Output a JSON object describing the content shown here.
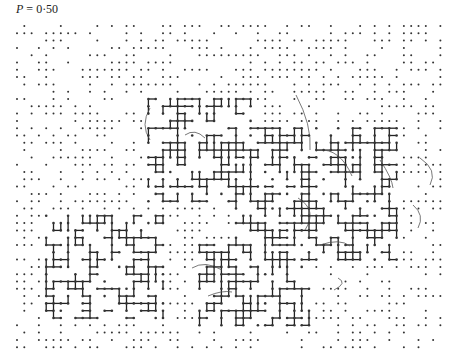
{
  "figure": {
    "label_var": "P",
    "label_eq": " = ",
    "label_value": "0·50"
  },
  "lattice": {
    "origin_x": 17,
    "origin_y": 26,
    "spacing": 7.3,
    "cols": 59,
    "rows": 45,
    "occupation_probability": 0.5,
    "site_color": "#333333",
    "bond_color": "#222222",
    "contour_color": "#555555"
  },
  "clusters": [
    {
      "name": "upper-central-cluster",
      "bbox": [
        18,
        10,
        32,
        24
      ]
    },
    {
      "name": "right-cluster",
      "bbox": [
        30,
        14,
        52,
        32
      ]
    },
    {
      "name": "lower-left-cluster",
      "bbox": [
        4,
        26,
        20,
        40
      ]
    },
    {
      "name": "lower-middle-cluster",
      "bbox": [
        25,
        30,
        40,
        41
      ]
    }
  ]
}
